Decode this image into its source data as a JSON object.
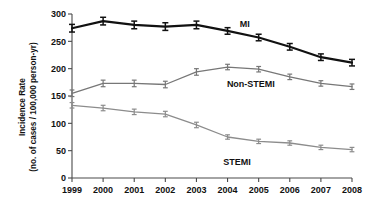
{
  "chart_data": {
    "type": "line",
    "title": "",
    "xlabel": "",
    "ylabel": "Incidence Rate (no. of cases / 100,000 person-yr)",
    "ylabel_line1": "Incidence Rate",
    "ylabel_line2": "(no. of cases / 100,000 person-yr)",
    "categories": [
      "1999",
      "2000",
      "2001",
      "2002",
      "2003",
      "2004",
      "2005",
      "2006",
      "2007",
      "2008"
    ],
    "x": [
      1999,
      2000,
      2001,
      2002,
      2003,
      2004,
      2005,
      2006,
      2007,
      2008
    ],
    "ylim": [
      0,
      300
    ],
    "yticks": [
      "0",
      "50",
      "100",
      "150",
      "200",
      "250",
      "300"
    ],
    "ytick_values": [
      0,
      50,
      100,
      150,
      200,
      250,
      300
    ],
    "grid": false,
    "legend_position": "inline-annotations",
    "series": [
      {
        "name": "MI",
        "color": "#111111",
        "line_width": 2.2,
        "values": [
          274,
          287,
          280,
          277,
          280,
          269,
          257,
          240,
          221,
          211
        ],
        "error_bars": [
          7,
          7,
          7,
          7,
          7,
          6,
          6,
          6,
          6,
          6
        ],
        "label_x": 2004.55,
        "label_y": 283
      },
      {
        "name": "Non-STEMI",
        "color": "#777777",
        "line_width": 1.3,
        "values": [
          155,
          173,
          173,
          171,
          194,
          203,
          199,
          185,
          173,
          167
        ],
        "error_bars": [
          6,
          6,
          6,
          6,
          6,
          5,
          5,
          5,
          5,
          5
        ],
        "label_x": 2004.75,
        "label_y": 172
      },
      {
        "name": "STEMI",
        "color": "#8c8c8c",
        "line_width": 1.3,
        "values": [
          133,
          128,
          121,
          117,
          97,
          75,
          67,
          64,
          56,
          52
        ],
        "error_bars": [
          5,
          5,
          5,
          5,
          5,
          4,
          4,
          4,
          4,
          4
        ],
        "label_x": 2004.3,
        "label_y": 30
      }
    ]
  }
}
